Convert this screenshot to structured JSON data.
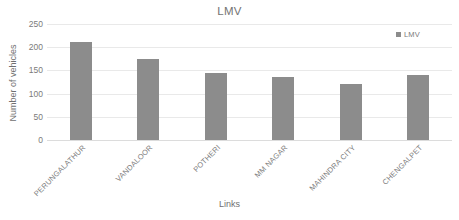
{
  "chart_data": {
    "type": "bar",
    "title": "LMV",
    "xlabel": "Links",
    "ylabel": "Number of vehicles",
    "categories": [
      "PERUNGALATHUR",
      "VANDALOOR",
      "POTHERI",
      "MM NAGAR",
      "MAHINDRA CITY",
      "CHENGALPET"
    ],
    "series": [
      {
        "name": "LMV",
        "values": [
          211,
          175,
          145,
          135,
          120,
          140
        ],
        "color": "#8c8c8c"
      }
    ],
    "values": [
      211,
      175,
      145,
      135,
      120,
      140
    ],
    "ylim": [
      0,
      250
    ],
    "yticks": [
      0,
      50,
      100,
      150,
      200,
      250
    ],
    "ytick_labels": [
      "0",
      "50",
      "100",
      "150",
      "200",
      "250"
    ],
    "grid": true,
    "legend": {
      "position": "top-right",
      "entries": [
        {
          "label": "LMV",
          "color": "#8c8c8c",
          "marker": "square"
        }
      ]
    },
    "xtick_rotation": -45,
    "background": "#ffffff",
    "gridline_color": "#e9e9e9",
    "text_color": "#737373"
  }
}
